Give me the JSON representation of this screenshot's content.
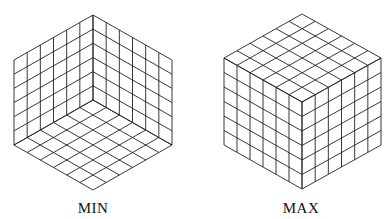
{
  "diagram": {
    "grid_divisions": 6,
    "line_color": "#222222",
    "cubes": [
      {
        "name": "min",
        "label": "MIN",
        "view": "concave-interior",
        "top": [
          93,
          15
        ],
        "center": [
          93,
          100
        ],
        "bottom": [
          93,
          190
        ],
        "left_x": 14,
        "right_x": 172,
        "upper_y": 60,
        "lower_y": 145,
        "label_pos": [
          93,
          200
        ]
      },
      {
        "name": "max",
        "label": "MAX",
        "view": "convex-exterior",
        "top": [
          302,
          14
        ],
        "center": [
          302,
          102
        ],
        "bottom": [
          302,
          189
        ],
        "left_x": 224,
        "right_x": 381,
        "upper_y": 58,
        "lower_y": 145,
        "label_pos": [
          301,
          200
        ]
      }
    ]
  }
}
